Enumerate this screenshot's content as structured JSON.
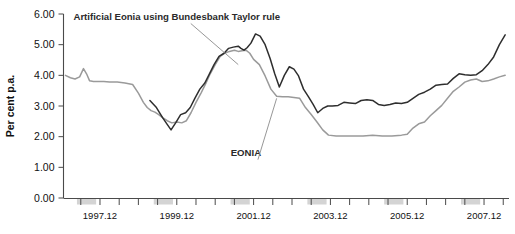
{
  "chart_data": {
    "type": "line",
    "title": "",
    "xlabel": "",
    "ylabel": "Per cent p.a.",
    "ylim": [
      0.0,
      6.0
    ],
    "yticks": [
      0.0,
      1.0,
      2.0,
      3.0,
      4.0,
      5.0,
      6.0
    ],
    "ytick_labels": [
      "0.00",
      "1.00",
      "2.00",
      "3.00",
      "4.00",
      "5.00",
      "6.00"
    ],
    "xlim": [
      1997.0,
      2008.6
    ],
    "xtick_labels": [
      "1997.12",
      "1999.12",
      "2001.12",
      "2003.12",
      "2005.12",
      "2007.12"
    ],
    "xtick_values": [
      1997.95,
      1999.95,
      2001.95,
      2003.95,
      2005.95,
      2007.95
    ],
    "minor_tick_step": 0.5,
    "grid": false,
    "legend_position": "inline-annotations",
    "annotations": [
      {
        "text": "Artificial Eonia using Bundesbank Taylor rule",
        "x": 1999.95,
        "y": 5.82,
        "leader_to_x": 2001.55,
        "leader_to_y": 4.35
      },
      {
        "text": "EONIA",
        "x": 2001.75,
        "y": 1.38,
        "leader_to_x": 2002.55,
        "leader_to_y": 3.25
      }
    ],
    "series": [
      {
        "name": "Artificial Eonia using Bundesbank Taylor rule",
        "color": "#2e2e2e",
        "x": [
          1999.25,
          1999.42,
          1999.58,
          1999.7,
          1999.8,
          1999.92,
          2000.05,
          2000.18,
          2000.3,
          2000.42,
          2000.55,
          2000.68,
          2000.8,
          2000.92,
          2001.05,
          2001.18,
          2001.3,
          2001.42,
          2001.55,
          2001.62,
          2001.7,
          2001.78,
          2001.88,
          2002.0,
          2002.12,
          2002.25,
          2002.38,
          2002.5,
          2002.62,
          2002.75,
          2002.88,
          2003.0,
          2003.12,
          2003.25,
          2003.38,
          2003.5,
          2003.62,
          2003.75,
          2003.88,
          2004.0,
          2004.15,
          2004.3,
          2004.45,
          2004.6,
          2004.75,
          2004.9,
          2005.05,
          2005.2,
          2005.35,
          2005.5,
          2005.65,
          2005.8,
          2005.95,
          2006.1,
          2006.25,
          2006.4,
          2006.55,
          2006.7,
          2006.85,
          2007.0,
          2007.15,
          2007.3,
          2007.45,
          2007.6,
          2007.75,
          2007.9,
          2008.05,
          2008.2,
          2008.35,
          2008.5
        ],
        "y": [
          3.18,
          2.95,
          2.62,
          2.4,
          2.22,
          2.45,
          2.72,
          2.78,
          2.95,
          3.25,
          3.55,
          3.75,
          4.05,
          4.35,
          4.62,
          4.72,
          4.88,
          4.92,
          4.95,
          4.88,
          4.82,
          4.9,
          5.05,
          5.35,
          5.28,
          5.0,
          4.55,
          4.05,
          3.62,
          4.0,
          4.28,
          4.2,
          3.98,
          3.55,
          3.3,
          3.05,
          2.78,
          2.92,
          3.0,
          3.0,
          3.02,
          3.12,
          3.1,
          3.08,
          3.18,
          3.2,
          3.18,
          3.05,
          3.02,
          3.05,
          3.1,
          3.08,
          3.12,
          3.25,
          3.38,
          3.45,
          3.55,
          3.68,
          3.7,
          3.72,
          3.9,
          4.05,
          4.02,
          4.0,
          4.02,
          4.15,
          4.35,
          4.6,
          5.0,
          5.32
        ]
      },
      {
        "name": "EONIA",
        "color": "#9a9a9a",
        "x": [
          1997.05,
          1997.18,
          1997.3,
          1997.42,
          1997.52,
          1997.6,
          1997.68,
          1997.78,
          1997.9,
          1998.05,
          1998.2,
          1998.4,
          1998.6,
          1998.8,
          1998.95,
          1999.08,
          1999.18,
          1999.28,
          1999.38,
          1999.48,
          1999.58,
          1999.7,
          1999.82,
          1999.95,
          2000.08,
          2000.2,
          2000.32,
          2000.45,
          2000.58,
          2000.7,
          2000.82,
          2000.95,
          2001.08,
          2001.2,
          2001.32,
          2001.45,
          2001.55,
          2001.65,
          2001.75,
          2001.85,
          2001.95,
          2002.1,
          2002.25,
          2002.4,
          2002.55,
          2002.7,
          2002.85,
          2003.0,
          2003.15,
          2003.3,
          2003.45,
          2003.6,
          2003.75,
          2003.9,
          2004.1,
          2004.3,
          2004.55,
          2004.8,
          2005.05,
          2005.3,
          2005.55,
          2005.8,
          2005.95,
          2006.1,
          2006.25,
          2006.4,
          2006.55,
          2006.7,
          2006.85,
          2007.0,
          2007.15,
          2007.3,
          2007.45,
          2007.6,
          2007.75,
          2007.9,
          2008.05,
          2008.2,
          2008.35,
          2008.5
        ],
        "y": [
          4.0,
          3.92,
          3.88,
          3.95,
          4.22,
          4.05,
          3.82,
          3.8,
          3.8,
          3.8,
          3.78,
          3.78,
          3.75,
          3.7,
          3.42,
          3.12,
          2.95,
          2.85,
          2.8,
          2.72,
          2.62,
          2.52,
          2.45,
          2.48,
          2.45,
          2.52,
          2.78,
          3.12,
          3.42,
          3.72,
          4.05,
          4.35,
          4.62,
          4.72,
          4.78,
          4.82,
          4.78,
          4.8,
          4.82,
          4.72,
          4.52,
          4.35,
          3.98,
          3.55,
          3.32,
          3.3,
          3.3,
          3.28,
          3.25,
          2.95,
          2.72,
          2.48,
          2.22,
          2.05,
          2.02,
          2.02,
          2.02,
          2.02,
          2.05,
          2.02,
          2.02,
          2.05,
          2.08,
          2.28,
          2.42,
          2.48,
          2.68,
          2.85,
          3.02,
          3.25,
          3.48,
          3.62,
          3.78,
          3.85,
          3.88,
          3.8,
          3.82,
          3.88,
          3.95,
          4.0
        ]
      }
    ],
    "x_axis_bands": [
      {
        "from": 1997.35,
        "to": 1997.85
      },
      {
        "from": 1999.35,
        "to": 1999.85
      },
      {
        "from": 2001.35,
        "to": 2001.85
      },
      {
        "from": 2003.35,
        "to": 2003.85
      },
      {
        "from": 2005.35,
        "to": 2005.85
      },
      {
        "from": 2007.35,
        "to": 2007.85
      }
    ]
  }
}
